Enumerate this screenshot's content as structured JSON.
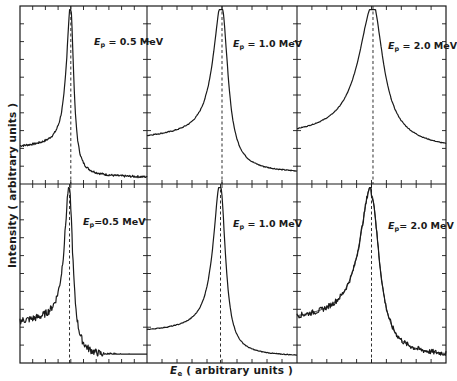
{
  "chart_data": {
    "type": "line",
    "layout": "2x3 grid of panels sharing axes",
    "xlabel": "E_e ( arbitrary units )",
    "ylabel": "Intensity ( arbitrary units )",
    "xlabel_symbol": "E",
    "xlabel_sub": "e",
    "xlabel_rest": " ( arbitrary units )",
    "grid": false,
    "ticks": "inward on all sides, no numeric tick labels",
    "peak_marker": "vertical dashed line at peak position in each panel",
    "panels": [
      {
        "row": 0,
        "col": 0,
        "label": "E_p = 0.5 MeV",
        "sym": "E",
        "sub": "p",
        "rest": " = 0.5 MeV",
        "peak_x": 0.4,
        "peak_y": 0.96,
        "left_bg": 0.22,
        "right_bg": 0.06,
        "width": 0.035,
        "noise": 0.006,
        "fit_overlay": false
      },
      {
        "row": 0,
        "col": 1,
        "label": "E_p = 1.0 MeV",
        "sym": "E",
        "sub": "p",
        "rest": " = 1.0 MeV",
        "peak_x": 0.5,
        "peak_y": 0.96,
        "left_bg": 0.28,
        "right_bg": 0.1,
        "width": 0.06,
        "noise": 0.003,
        "fit_overlay": false
      },
      {
        "row": 0,
        "col": 2,
        "label": "E_p = 2.0 MeV",
        "sym": "E",
        "sub": "p",
        "rest": " = 2.0 MeV",
        "peak_x": 0.51,
        "peak_y": 0.92,
        "left_bg": 0.3,
        "right_bg": 0.32,
        "width": 0.1,
        "noise": 0.002,
        "fit_overlay": false
      },
      {
        "row": 1,
        "col": 0,
        "label": "E_p = 0.5 MeV",
        "sym": "E",
        "sub": "p",
        "rest": "=0.5 MeV",
        "peak_x": 0.39,
        "peak_y": 0.94,
        "left_bg": 0.24,
        "right_bg": 0.05,
        "width": 0.04,
        "noise": 0.02,
        "fit_overlay": false
      },
      {
        "row": 1,
        "col": 1,
        "label": "E_p = 1.0 MeV",
        "sym": "E",
        "sub": "p",
        "rest": " = 1.0 MeV",
        "peak_x": 0.49,
        "peak_y": 0.97,
        "left_bg": 0.19,
        "right_bg": 0.06,
        "width": 0.05,
        "noise": 0.002,
        "fit_overlay": false
      },
      {
        "row": 1,
        "col": 2,
        "label": "E_p = 2.0 MeV",
        "sym": "E",
        "sub": "p",
        "rest": "= 2.0 MeV",
        "peak_x": 0.5,
        "peak_y": 0.92,
        "left_bg": 0.26,
        "right_bg": 0.06,
        "width": 0.08,
        "noise": 0.015,
        "fit_overlay": true
      }
    ]
  },
  "labels": {
    "ylabel": "Intensity ( arbitrary units )",
    "xlabel_symbol": "E",
    "xlabel_sub": "e",
    "xlabel_rest": " ( arbitrary units )",
    "p0": {
      "sym": "E",
      "sub": "p",
      "rest": " = 0.5 MeV"
    },
    "p1": {
      "sym": "E",
      "sub": "p",
      "rest": " = 1.0 MeV"
    },
    "p2": {
      "sym": "E",
      "sub": "p",
      "rest": " = 2.0 MeV"
    },
    "p3": {
      "sym": "E",
      "sub": "p",
      "rest": "=0.5 MeV"
    },
    "p4": {
      "sym": "E",
      "sub": "p",
      "rest": " = 1.0 MeV"
    },
    "p5": {
      "sym": "E",
      "sub": "p",
      "rest": "= 2.0 MeV"
    }
  }
}
